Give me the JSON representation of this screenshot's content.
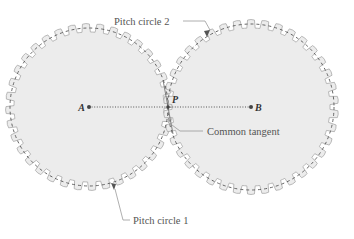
{
  "diagram": {
    "colors": {
      "gear_fill": "#ececec",
      "gear_outline": "#a8a8a8",
      "pitch_circle": "#555555",
      "center_line": "#555555",
      "label_text": "#555555",
      "leader_line": "#9a9a9a"
    },
    "points": {
      "A": {
        "label": "A",
        "x": 89,
        "y": 107
      },
      "B": {
        "label": "B",
        "x": 251,
        "y": 107
      },
      "P": {
        "label": "P",
        "x": 168,
        "y": 107
      }
    },
    "gears": [
      {
        "name": "gear-1",
        "center": "A",
        "pitch_radius": 79,
        "teeth": 36
      },
      {
        "name": "gear-2",
        "center": "B",
        "pitch_radius": 83,
        "teeth": 38
      }
    ],
    "labels": {
      "pitch_circle_2": "Pitch circle 2",
      "pitch_circle_1": "Pitch circle 1",
      "common_tangent": "Common tangent"
    }
  }
}
